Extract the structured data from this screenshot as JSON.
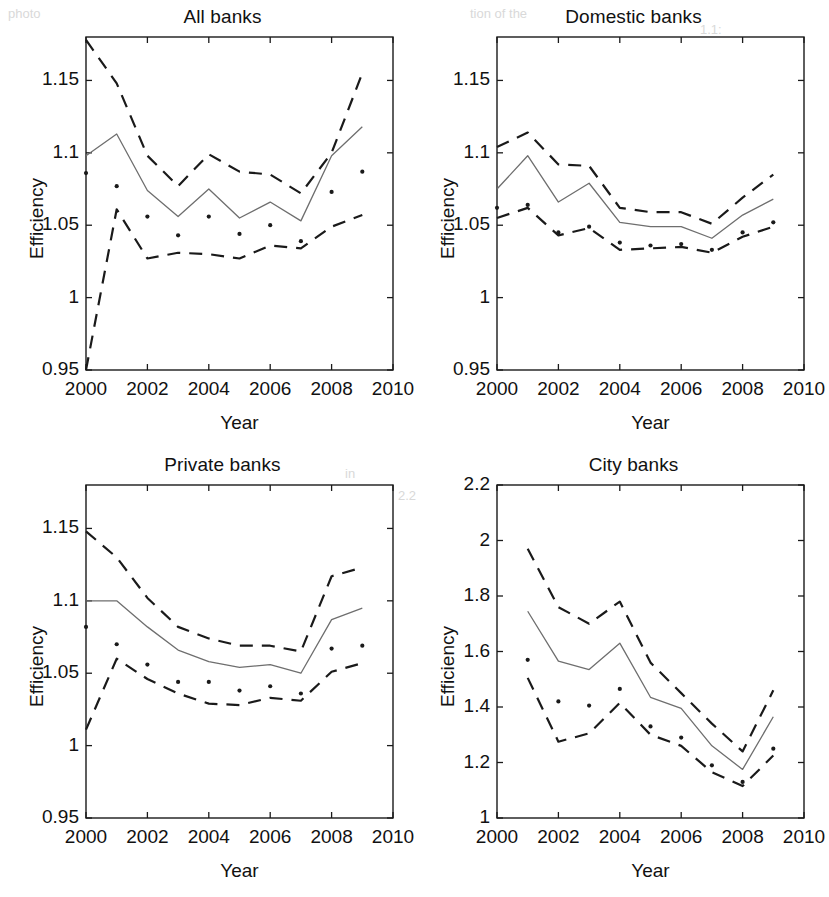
{
  "figure": {
    "panel_count": 4,
    "background": "#ffffff",
    "ink": "#1a1a1a",
    "solid_color": "#6e6e6e",
    "dashed_color": "#1a1a1a",
    "dot_color": "#1a1a1a"
  },
  "labels": {
    "ylabel": "Efficiency",
    "xlabel": "Year"
  },
  "chart_data": [
    {
      "type": "line",
      "title": "All banks",
      "xlabel": "Year",
      "ylabel": "Efficiency",
      "xlim": [
        2000,
        2010
      ],
      "ylim": [
        0.95,
        1.18
      ],
      "xticks": [
        2000,
        2002,
        2004,
        2006,
        2008,
        2010
      ],
      "xtick_labels": [
        "2000",
        "2002",
        "2004",
        "2006",
        "2008",
        "2010"
      ],
      "yticks": [
        0.95,
        1.0,
        1.05,
        1.1,
        1.15
      ],
      "ytick_labels": [
        "0.95",
        "1",
        "1.05",
        "1.1",
        "1.15"
      ],
      "grid": false,
      "legend": "none",
      "x": [
        2000,
        2001,
        2002,
        2003,
        2004,
        2005,
        2006,
        2007,
        2008,
        2009
      ],
      "series": [
        {
          "name": "Upper confidence bound",
          "style": "dashed",
          "values": [
            1.178,
            1.148,
            1.098,
            1.077,
            1.099,
            1.087,
            1.085,
            1.072,
            1.1,
            1.155
          ]
        },
        {
          "name": "Mean efficiency",
          "style": "solid",
          "values": [
            1.098,
            1.113,
            1.074,
            1.056,
            1.075,
            1.055,
            1.066,
            1.053,
            1.098,
            1.118
          ]
        },
        {
          "name": "Lower confidence bound",
          "style": "dashed",
          "values": [
            0.95,
            1.061,
            1.027,
            1.031,
            1.03,
            1.027,
            1.036,
            1.034,
            1.049,
            1.057
          ]
        },
        {
          "name": "Observed efficiency",
          "style": "dots",
          "values": [
            1.086,
            1.077,
            1.056,
            1.043,
            1.056,
            1.044,
            1.05,
            1.039,
            1.073,
            1.087
          ]
        }
      ]
    },
    {
      "type": "line",
      "title": "Domestic banks",
      "xlabel": "Year",
      "ylabel": "Efficiency",
      "xlim": [
        2000,
        2010
      ],
      "ylim": [
        0.95,
        1.18
      ],
      "xticks": [
        2000,
        2002,
        2004,
        2006,
        2008,
        2010
      ],
      "xtick_labels": [
        "2000",
        "2002",
        "2004",
        "2006",
        "2008",
        "2010"
      ],
      "yticks": [
        0.95,
        1.0,
        1.05,
        1.1,
        1.15
      ],
      "ytick_labels": [
        "0.95",
        "1",
        "1.05",
        "1.1",
        "1.15"
      ],
      "grid": false,
      "legend": "none",
      "x": [
        2000,
        2001,
        2002,
        2003,
        2004,
        2005,
        2006,
        2007,
        2008,
        2009
      ],
      "series": [
        {
          "name": "Upper confidence bound",
          "style": "dashed",
          "values": [
            1.104,
            1.114,
            1.092,
            1.091,
            1.062,
            1.059,
            1.059,
            1.051,
            1.069,
            1.085
          ]
        },
        {
          "name": "Mean efficiency",
          "style": "solid",
          "values": [
            1.075,
            1.098,
            1.066,
            1.079,
            1.052,
            1.049,
            1.049,
            1.041,
            1.057,
            1.068
          ]
        },
        {
          "name": "Lower confidence bound",
          "style": "dashed",
          "values": [
            1.055,
            1.062,
            1.043,
            1.048,
            1.033,
            1.034,
            1.035,
            1.031,
            1.042,
            1.049
          ]
        },
        {
          "name": "Observed efficiency",
          "style": "dots",
          "values": [
            1.062,
            1.064,
            1.045,
            1.049,
            1.038,
            1.036,
            1.037,
            1.033,
            1.045,
            1.052
          ]
        }
      ]
    },
    {
      "type": "line",
      "title": "Private banks",
      "xlabel": "Year",
      "ylabel": "Efficiency",
      "xlim": [
        2000,
        2010
      ],
      "ylim": [
        0.95,
        1.18
      ],
      "xticks": [
        2000,
        2002,
        2004,
        2006,
        2008,
        2010
      ],
      "xtick_labels": [
        "2000",
        "2002",
        "2004",
        "2006",
        "2008",
        "2010"
      ],
      "yticks": [
        0.95,
        1.0,
        1.05,
        1.1,
        1.15
      ],
      "ytick_labels": [
        "0.95",
        "1",
        "1.05",
        "1.1",
        "1.15"
      ],
      "grid": false,
      "legend": "none",
      "x": [
        2000,
        2001,
        2002,
        2003,
        2004,
        2005,
        2006,
        2007,
        2008,
        2009
      ],
      "series": [
        {
          "name": "Upper confidence bound",
          "style": "dashed",
          "values": [
            1.148,
            1.13,
            1.102,
            1.082,
            1.074,
            1.069,
            1.069,
            1.065,
            1.117,
            1.123
          ]
        },
        {
          "name": "Mean efficiency",
          "style": "solid",
          "values": [
            1.1,
            1.1,
            1.082,
            1.066,
            1.058,
            1.054,
            1.056,
            1.05,
            1.087,
            1.095
          ]
        },
        {
          "name": "Lower confidence bound",
          "style": "dashed",
          "values": [
            1.011,
            1.06,
            1.046,
            1.036,
            1.029,
            1.028,
            1.033,
            1.031,
            1.051,
            1.057
          ]
        },
        {
          "name": "Observed efficiency",
          "style": "dots",
          "values": [
            1.082,
            1.07,
            1.056,
            1.044,
            1.044,
            1.038,
            1.041,
            1.036,
            1.067,
            1.069
          ]
        }
      ]
    },
    {
      "type": "line",
      "title": "City banks",
      "xlabel": "Year",
      "ylabel": "Efficiency",
      "xlim": [
        2000,
        2010
      ],
      "ylim": [
        1.0,
        2.2
      ],
      "xticks": [
        2000,
        2002,
        2004,
        2006,
        2008,
        2010
      ],
      "xtick_labels": [
        "2000",
        "2002",
        "2004",
        "2006",
        "2008",
        "2010"
      ],
      "yticks": [
        1.0,
        1.2,
        1.4,
        1.6,
        1.8,
        2.0,
        2.2
      ],
      "ytick_labels": [
        "1",
        "1.2",
        "1.4",
        "1.6",
        "1.8",
        "2",
        "2.2"
      ],
      "grid": false,
      "legend": "none",
      "x": [
        2001,
        2002,
        2003,
        2004,
        2005,
        2006,
        2007,
        2008,
        2009
      ],
      "series": [
        {
          "name": "Upper confidence bound",
          "style": "dashed",
          "values": [
            1.97,
            1.76,
            1.7,
            1.78,
            1.56,
            1.45,
            1.34,
            1.24,
            1.46
          ]
        },
        {
          "name": "Mean efficiency",
          "style": "solid",
          "values": [
            1.745,
            1.565,
            1.535,
            1.63,
            1.435,
            1.395,
            1.26,
            1.175,
            1.365
          ]
        },
        {
          "name": "Lower confidence bound",
          "style": "dashed",
          "values": [
            1.505,
            1.275,
            1.305,
            1.415,
            1.3,
            1.26,
            1.165,
            1.115,
            1.225
          ]
        },
        {
          "name": "Observed efficiency",
          "style": "dots",
          "values": [
            1.57,
            1.42,
            1.405,
            1.465,
            1.33,
            1.29,
            1.19,
            1.13,
            1.25
          ]
        }
      ]
    }
  ],
  "bleed_marks": [
    {
      "text": "photo",
      "x": 8,
      "y": 6
    },
    {
      "text": "tion of the",
      "x": 470,
      "y": 6
    },
    {
      "text": "1.1:",
      "x": 700,
      "y": 22
    },
    {
      "text": "in",
      "x": 345,
      "y": 466
    },
    {
      "text": "2.2",
      "x": 398,
      "y": 488
    }
  ]
}
